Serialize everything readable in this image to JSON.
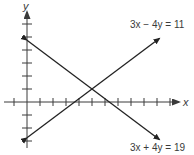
{
  "figure": {
    "axes": {
      "x_label": "x",
      "y_label": "y",
      "origin_px": [
        27,
        102
      ],
      "unit_px": 13,
      "x_ticks": [
        -1,
        1,
        2,
        3,
        4,
        5,
        6,
        7,
        8,
        9,
        10,
        11
      ],
      "y_ticks": [
        -3,
        -2,
        -1,
        1,
        2,
        3,
        4,
        5,
        6
      ],
      "color": "#3a3a3a"
    },
    "lines": [
      {
        "equation": "3x − 4y = 11",
        "a": 3,
        "b": -4,
        "c": 11,
        "x_range": [
          0,
          10.2
        ],
        "label_pos": "upper-right",
        "color": "#222222"
      },
      {
        "equation": "3x + 4y = 19",
        "a": 3,
        "b": 4,
        "c": 19,
        "x_range": [
          0,
          10.2
        ],
        "label_pos": "lower-right",
        "color": "#222222"
      }
    ],
    "intersection": {
      "x": 5,
      "y": 1
    }
  }
}
